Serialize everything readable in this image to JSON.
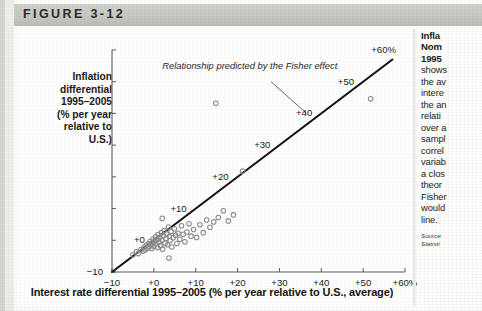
{
  "figure": {
    "label": "FIGURE 3-12"
  },
  "side_panel": {
    "heading_lines": [
      "Infla",
      "Nom",
      "1995"
    ],
    "body_lines": [
      "shows",
      "the av",
      "intere",
      "the an",
      "relati",
      "over a",
      "sampl",
      "correl",
      "variab",
      "a clos",
      "theor",
      "Fisher",
      "would",
      "line."
    ],
    "source_lines": [
      "Source:",
      "Statisti"
    ]
  },
  "chart_data": {
    "type": "scatter",
    "title": "",
    "ylabel": "Inflation differential 1995–2005 (% per year relative to U.S.)",
    "ylabel_lines": [
      "Inflation",
      "differential",
      "1995–2005",
      "(% per year",
      "relative to",
      "U.S.)"
    ],
    "xlabel": "Interest rate differential 1995–2005 (% per year relative to U.S., average)",
    "xlim": [
      -10,
      60
    ],
    "ylim": [
      -10,
      60
    ],
    "xticks": [
      -10,
      0,
      10,
      20,
      30,
      40,
      50,
      60
    ],
    "yticks": [
      -10,
      0,
      10,
      20,
      30,
      40,
      50,
      60
    ],
    "xticklabels": [
      "−10",
      "+0",
      "+10",
      "+20",
      "+30",
      "+40",
      "+50",
      "+60%"
    ],
    "yticklabels": [
      "−10",
      "+0",
      "+10",
      "+20",
      "+30",
      "+40",
      "+50",
      "+60%"
    ],
    "grid": false,
    "legend": null,
    "annotations": [
      {
        "text": "Relationship predicted by the Fisher effect",
        "x": 2,
        "y": 55,
        "style": "italic",
        "leader_from": [
          28,
          50
        ],
        "leader_to": [
          36.5,
          40
        ]
      }
    ],
    "reference_line": {
      "name": "45-degree line (Fisher effect)",
      "slope": 1,
      "intercept": 0,
      "x_from": -10,
      "x_to": 57,
      "color": "#111111"
    },
    "marker": {
      "shape": "open-circle",
      "color": "#8d8d8d",
      "size": 4.6
    },
    "points": [
      [
        -5.0,
        -4.6
      ],
      [
        -4.2,
        -3.6
      ],
      [
        -3.7,
        -4.2
      ],
      [
        -3.1,
        -2.9
      ],
      [
        -2.6,
        -3.4
      ],
      [
        -2.3,
        -2.2
      ],
      [
        -2.0,
        -3.0
      ],
      [
        -1.8,
        -1.6
      ],
      [
        -1.5,
        -2.5
      ],
      [
        -1.3,
        -1.1
      ],
      [
        -1.1,
        -2.0
      ],
      [
        -0.9,
        -0.4
      ],
      [
        -0.7,
        -1.5
      ],
      [
        -0.5,
        -2.6
      ],
      [
        -0.3,
        -0.8
      ],
      [
        -0.2,
        0.4
      ],
      [
        0.0,
        -1.9
      ],
      [
        0.2,
        -0.2
      ],
      [
        0.4,
        1.1
      ],
      [
        0.5,
        -1.2
      ],
      [
        0.7,
        0.2
      ],
      [
        0.9,
        -2.3
      ],
      [
        1.0,
        1.8
      ],
      [
        1.2,
        -0.6
      ],
      [
        1.4,
        0.9
      ],
      [
        1.6,
        -1.7
      ],
      [
        1.8,
        2.4
      ],
      [
        1.9,
        0.1
      ],
      [
        2.1,
        -2.8
      ],
      [
        2.3,
        1.4
      ],
      [
        2.5,
        3.1
      ],
      [
        2.7,
        -0.9
      ],
      [
        2.9,
        0.6
      ],
      [
        3.1,
        2.0
      ],
      [
        3.3,
        -1.4
      ],
      [
        3.5,
        4.2
      ],
      [
        3.7,
        1.2
      ],
      [
        3.9,
        -0.1
      ],
      [
        4.1,
        2.8
      ],
      [
        4.3,
        -2.1
      ],
      [
        4.6,
        0.8
      ],
      [
        4.9,
        3.6
      ],
      [
        5.2,
        1.6
      ],
      [
        5.5,
        -1.0
      ],
      [
        5.8,
        2.2
      ],
      [
        6.2,
        0.3
      ],
      [
        6.6,
        4.6
      ],
      [
        7.0,
        1.9
      ],
      [
        7.4,
        -0.5
      ],
      [
        7.9,
        2.6
      ],
      [
        8.4,
        5.2
      ],
      [
        8.9,
        1.3
      ],
      [
        9.5,
        3.4
      ],
      [
        10.2,
        0.9
      ],
      [
        11.0,
        4.9
      ],
      [
        11.8,
        2.4
      ],
      [
        12.6,
        6.4
      ],
      [
        13.4,
        4.1
      ],
      [
        14.3,
        5.8
      ],
      [
        15.4,
        7.2
      ],
      [
        16.6,
        9.3
      ],
      [
        17.8,
        6.1
      ],
      [
        19.0,
        8.0
      ],
      [
        2.0,
        6.9
      ],
      [
        3.6,
        -5.6
      ],
      [
        21.2,
        21.8
      ],
      [
        14.8,
        43.2
      ],
      [
        51.8,
        44.6
      ]
    ]
  }
}
